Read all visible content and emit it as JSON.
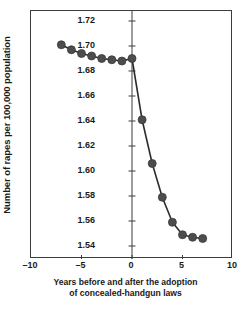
{
  "chart_data": {
    "type": "line",
    "title": "",
    "xlabel": "Years before and after the adoption of concealed-handgun laws",
    "xlabel_line1": "Years before and after the adoption",
    "xlabel_line2": "of concealed-handgun laws",
    "ylabel": "Number of rapes per 100,000 population",
    "xlim": [
      -10,
      10
    ],
    "ylim": [
      1.54,
      1.72
    ],
    "grid": false,
    "legend": null,
    "marker": "filled-circle",
    "marker_color": "#4d4d4d",
    "line_color": "#2b2b2b",
    "frame_color": "#3c3c3c",
    "xticks": [
      -10,
      -5,
      0,
      5,
      10
    ],
    "xtick_labels": [
      "–10",
      "–5",
      "0",
      "5",
      "10"
    ],
    "yticks": [
      1.54,
      1.56,
      1.58,
      1.6,
      1.62,
      1.64,
      1.66,
      1.68,
      1.7,
      1.72
    ],
    "ytick_labels": [
      "1.54",
      "1.56",
      "1.58",
      "1.60",
      "1.62",
      "1.64",
      "1.66",
      "1.68",
      "1.70",
      "1.72"
    ],
    "x": [
      -7,
      -6,
      -5,
      -4,
      -3,
      -2,
      -1,
      0,
      1,
      2,
      3,
      4,
      5,
      6,
      7
    ],
    "values": [
      1.701,
      1.697,
      1.694,
      1.692,
      1.69,
      1.689,
      1.688,
      1.69,
      1.641,
      1.606,
      1.579,
      1.559,
      1.549,
      1.547,
      1.546
    ],
    "series": [
      {
        "name": "Rapes per 100,000 population",
        "points": [
          {
            "x": -7,
            "y": 1.701
          },
          {
            "x": -6,
            "y": 1.697
          },
          {
            "x": -5,
            "y": 1.694
          },
          {
            "x": -4,
            "y": 1.692
          },
          {
            "x": -3,
            "y": 1.69
          },
          {
            "x": -2,
            "y": 1.689
          },
          {
            "x": -1,
            "y": 1.688
          },
          {
            "x": 0,
            "y": 1.69
          },
          {
            "x": 1,
            "y": 1.641
          },
          {
            "x": 2,
            "y": 1.606
          },
          {
            "x": 3,
            "y": 1.579
          },
          {
            "x": 4,
            "y": 1.559
          },
          {
            "x": 5,
            "y": 1.549
          },
          {
            "x": 6,
            "y": 1.547
          },
          {
            "x": 7,
            "y": 1.546
          }
        ]
      }
    ]
  }
}
